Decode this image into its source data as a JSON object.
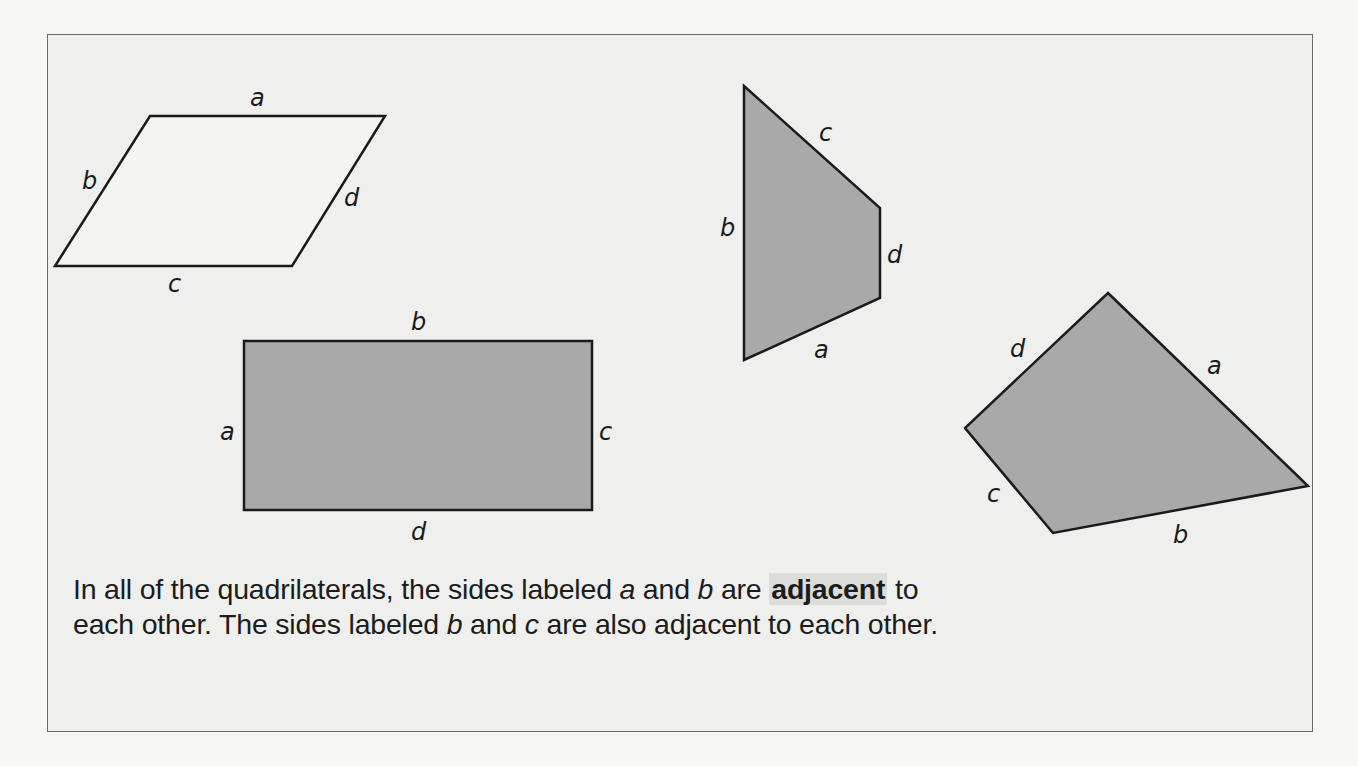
{
  "figure": {
    "fill_color": "#a9a9a9",
    "stroke_color": "#1a1a1a",
    "shapes": [
      {
        "name": "parallelogram",
        "filled": false,
        "points": "150,116 385,116 292,266 55,266",
        "labels": {
          "a": "a",
          "b": "b",
          "c": "c",
          "d": "d"
        }
      },
      {
        "name": "trapezoid",
        "filled": true,
        "points": "744,86 880,208 880,298 744,360",
        "labels": {
          "a": "a",
          "b": "b",
          "c": "c",
          "d": "d"
        }
      },
      {
        "name": "rectangle",
        "filled": true,
        "points": "244,341 592,341 592,510 244,510",
        "labels": {
          "a": "a",
          "b": "b",
          "c": "c",
          "d": "d"
        }
      },
      {
        "name": "kite-quadrilateral",
        "filled": true,
        "points": "1108,293 1308,486 1053,533 965,428",
        "labels": {
          "a": "a",
          "b": "b",
          "c": "c",
          "d": "d"
        }
      }
    ]
  },
  "caption": {
    "part1": "In all of the quadrilaterals, the sides labeled ",
    "var_a": "a",
    "part2": " and ",
    "var_b": "b",
    "part3": " are ",
    "term": "adjacent",
    "part4": " to each other. The sides labeled ",
    "var_b2": "b",
    "part5": " and ",
    "var_c": "c",
    "part6": " are also adjacent to each other."
  }
}
